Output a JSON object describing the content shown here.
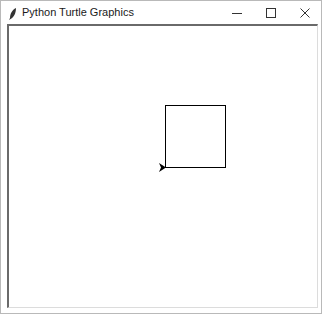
{
  "window": {
    "title": "Python Turtle Graphics",
    "controls": {
      "minimize": "minimize-icon",
      "maximize": "maximize-icon",
      "close": "close-icon"
    }
  },
  "canvas": {
    "background": "#ffffff",
    "square": {
      "x": 164,
      "y": 104,
      "width": 60,
      "height": 62,
      "stroke": "#000000"
    },
    "turtle": {
      "x": 164,
      "y": 166,
      "heading": "east",
      "color": "#000000"
    }
  }
}
